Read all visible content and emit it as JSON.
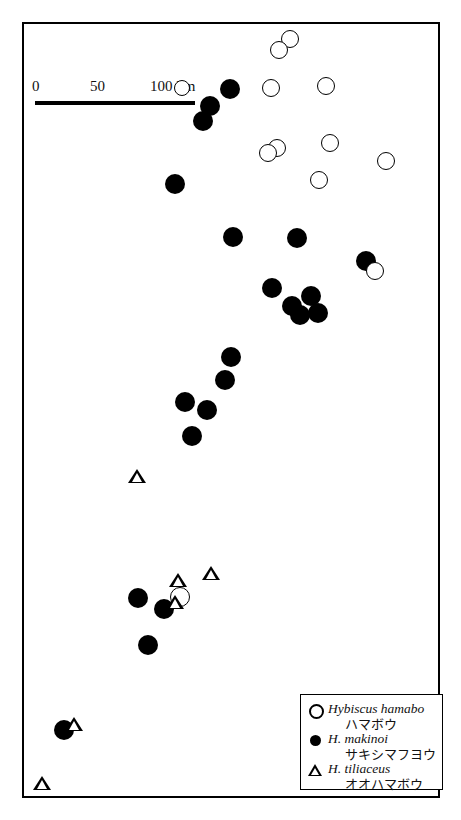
{
  "figure": {
    "kind": "distribution-map",
    "region": "Kyushu and Ryukyu Islands, Japan"
  },
  "scalebar": {
    "tick_0": "0",
    "tick_50": "50",
    "tick_100": "100 km",
    "length_km": 100
  },
  "legend": {
    "items": [
      {
        "symbol": "open-circle",
        "scientific": "Hybiscus hamabo",
        "japanese": "ハマボウ"
      },
      {
        "symbol": "filled-circle",
        "scientific": "H. makinoi",
        "japanese": "サキシマフヨウ"
      },
      {
        "symbol": "open-triangle",
        "scientific": "H. tiliaceus",
        "japanese": "オオハマボウ"
      }
    ]
  },
  "grid": {
    "vertical_x": [
      118,
      243,
      367
    ],
    "horizontal_y": [
      63,
      211,
      355,
      500,
      645
    ],
    "color": "#8a8a8a"
  },
  "frame": {
    "x": 22,
    "y": 22,
    "width": 418,
    "height": 776,
    "color": "#000000"
  },
  "points": {
    "open_circle": [
      {
        "x": 290,
        "y": 39,
        "r": 9
      },
      {
        "x": 279,
        "y": 50,
        "r": 9
      },
      {
        "x": 271,
        "y": 88,
        "r": 9
      },
      {
        "x": 326,
        "y": 86,
        "r": 9
      },
      {
        "x": 330,
        "y": 143,
        "r": 9
      },
      {
        "x": 277,
        "y": 148,
        "r": 9
      },
      {
        "x": 268,
        "y": 153,
        "r": 9
      },
      {
        "x": 319,
        "y": 180,
        "r": 9
      },
      {
        "x": 386,
        "y": 161,
        "r": 9
      },
      {
        "x": 375,
        "y": 271,
        "r": 9
      },
      {
        "x": 182,
        "y": 88,
        "r": 8
      },
      {
        "x": 180,
        "y": 597,
        "r": 10
      }
    ],
    "filled_circle": [
      {
        "x": 230,
        "y": 89,
        "r": 10
      },
      {
        "x": 210,
        "y": 106,
        "r": 10
      },
      {
        "x": 203,
        "y": 121,
        "r": 10
      },
      {
        "x": 175,
        "y": 184,
        "r": 10
      },
      {
        "x": 233,
        "y": 237,
        "r": 10
      },
      {
        "x": 297,
        "y": 238,
        "r": 10
      },
      {
        "x": 366,
        "y": 261,
        "r": 10
      },
      {
        "x": 272,
        "y": 288,
        "r": 10
      },
      {
        "x": 292,
        "y": 306,
        "r": 10
      },
      {
        "x": 311,
        "y": 296,
        "r": 10
      },
      {
        "x": 300,
        "y": 315,
        "r": 10
      },
      {
        "x": 318,
        "y": 313,
        "r": 10
      },
      {
        "x": 231,
        "y": 357,
        "r": 10
      },
      {
        "x": 225,
        "y": 380,
        "r": 10
      },
      {
        "x": 185,
        "y": 402,
        "r": 10
      },
      {
        "x": 207,
        "y": 410,
        "r": 10
      },
      {
        "x": 192,
        "y": 436,
        "r": 10
      },
      {
        "x": 138,
        "y": 598,
        "r": 10
      },
      {
        "x": 164,
        "y": 609,
        "r": 10
      },
      {
        "x": 148,
        "y": 645,
        "r": 10
      },
      {
        "x": 64,
        "y": 730,
        "r": 10
      }
    ],
    "open_triangle": [
      {
        "x": 137,
        "y": 478,
        "s": 9
      },
      {
        "x": 178,
        "y": 582,
        "s": 9
      },
      {
        "x": 211,
        "y": 575,
        "s": 9
      },
      {
        "x": 175,
        "y": 604,
        "s": 9
      },
      {
        "x": 74,
        "y": 726,
        "s": 9
      },
      {
        "x": 42,
        "y": 785,
        "s": 9
      }
    ]
  }
}
